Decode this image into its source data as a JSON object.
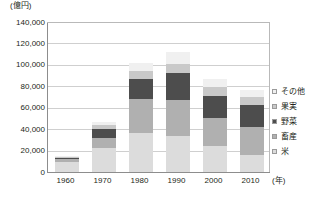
{
  "chart_data": {
    "type": "bar",
    "title": "",
    "subtitle": "",
    "unit_label": "(億円)",
    "xlabel": "(年)",
    "ylabel": "",
    "stacked": true,
    "grid": true,
    "legend_position": "right",
    "ylim": [
      0,
      140000
    ],
    "ytick_step": 20000,
    "categories": [
      "1960",
      "1970",
      "1980",
      "1990",
      "2000",
      "2010"
    ],
    "ytick_labels": [
      "140,000",
      "120,000",
      "100,000",
      "80,000",
      "60,000",
      "40,000",
      "20,000",
      "0"
    ],
    "ytick_values": [
      140000,
      120000,
      100000,
      80000,
      60000,
      40000,
      20000,
      0
    ],
    "series": [
      {
        "name": "米",
        "color": "#dcdcdc",
        "values": [
          9000,
          22000,
          36000,
          34000,
          24000,
          16000
        ]
      },
      {
        "name": "畜産",
        "color": "#b0b0b0",
        "values": [
          3000,
          10000,
          32000,
          33000,
          26000,
          26000
        ]
      },
      {
        "name": "野菜",
        "color": "#4d4d4d",
        "values": [
          1700,
          8000,
          19000,
          25000,
          21000,
          21000
        ]
      },
      {
        "name": "果実",
        "color": "#c9c9c9",
        "values": [
          700,
          3500,
          7000,
          9000,
          8000,
          7000
        ]
      },
      {
        "name": "その他",
        "color": "#f0f0f0",
        "values": [
          1000,
          3000,
          8000,
          11000,
          8000,
          7000
        ]
      }
    ],
    "totals": [
      15400,
      46500,
      102000,
      112000,
      87000,
      77000
    ]
  },
  "legend": {
    "items": [
      {
        "label": "その他",
        "color": "#f0f0f0"
      },
      {
        "label": "果実",
        "color": "#c9c9c9"
      },
      {
        "label": "野菜",
        "color": "#4d4d4d"
      },
      {
        "label": "畜産",
        "color": "#b0b0b0"
      },
      {
        "label": "米",
        "color": "#dcdcdc"
      }
    ]
  },
  "axes": {
    "y_unit": "(億円)",
    "x_unit": "(年)"
  }
}
